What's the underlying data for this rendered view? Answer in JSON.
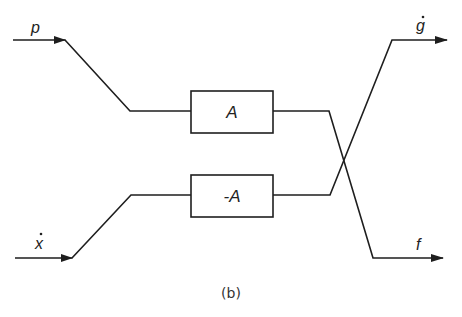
{
  "diagram": {
    "caption": "(b)",
    "inputs": [
      {
        "id": "p",
        "label": "p"
      },
      {
        "id": "x_dot",
        "label": "x",
        "dot": true
      }
    ],
    "blocks": [
      {
        "id": "A",
        "label": "A"
      },
      {
        "id": "neg_A",
        "label": "-A"
      }
    ],
    "outputs": [
      {
        "id": "g_dot",
        "label": "g",
        "dot": true
      },
      {
        "id": "f",
        "label": "f"
      }
    ],
    "connections": [
      {
        "from": "p",
        "to": "A"
      },
      {
        "from": "x_dot",
        "to": "neg_A"
      },
      {
        "from": "A",
        "to": "f"
      },
      {
        "from": "neg_A",
        "to": "g_dot"
      }
    ],
    "colors": {
      "stroke": "#1e1e1e",
      "background": "#ffffff"
    }
  }
}
